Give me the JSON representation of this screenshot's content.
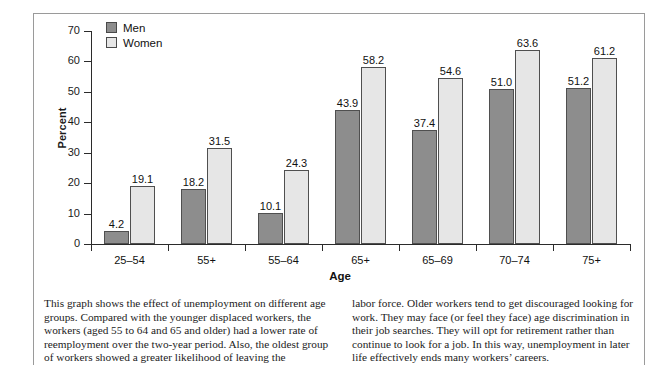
{
  "chart_data": {
    "type": "bar",
    "title": "",
    "xlabel": "Age",
    "ylabel": "Percent",
    "ylim": [
      0,
      70
    ],
    "yticks": [
      0,
      10,
      20,
      30,
      40,
      50,
      60,
      70
    ],
    "grid": false,
    "legend_position": "top-left",
    "categories": [
      "25–54",
      "55+",
      "55–64",
      "65+",
      "65–69",
      "70–74",
      "75+"
    ],
    "series": [
      {
        "name": "Men",
        "color": "#8d8d8d",
        "values": [
          4.2,
          18.2,
          10.1,
          43.9,
          37.4,
          51.0,
          51.2
        ],
        "labels": [
          "4.2",
          "18.2",
          "10.1",
          "43.9",
          "37.4",
          "51.0",
          "51.2"
        ]
      },
      {
        "name": "Women",
        "color": "#e6e6e6",
        "values": [
          19.1,
          31.5,
          24.3,
          58.2,
          54.6,
          63.6,
          61.2
        ],
        "labels": [
          "19.1",
          "31.5",
          "24.3",
          "58.2",
          "54.6",
          "63.6",
          "61.2"
        ]
      }
    ]
  },
  "legend": {
    "items": [
      {
        "label": "Men"
      },
      {
        "label": "Women"
      }
    ]
  },
  "caption": {
    "left": "This graph shows the effect of unemployment on different age groups. Compared with the younger displaced workers, the workers (aged 55 to 64 and 65 and older) had a lower rate of reemployment over the two-year period. Also, the oldest group of workers showed a greater likelihood of leaving the",
    "right": "labor force. Older workers tend to get discouraged looking for work. They may face (or feel they face) age discrimination in their job searches. They will opt for retirement rather than continue to look for a job. In this way, unemployment in later life effectively ends many workers’ careers."
  }
}
